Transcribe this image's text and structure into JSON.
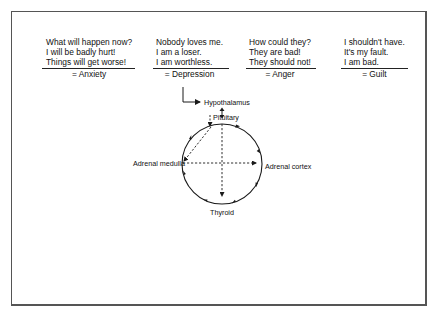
{
  "statements": [
    {
      "id": "anxiety",
      "lines": [
        "What will happen now?",
        "I will be badly hurt!",
        "Things will get worse!"
      ],
      "result": "= Anxiety"
    },
    {
      "id": "depression",
      "lines": [
        "Nobody loves me.",
        "I am a loser.",
        "I am worthless."
      ],
      "result": "= Depression"
    },
    {
      "id": "anger",
      "lines": [
        "How could they?",
        "They are bad!",
        "They should not!"
      ],
      "result": "= Anger"
    },
    {
      "id": "guilt",
      "lines": [
        "I shouldn't have.",
        "It's my fault.",
        "I am bad."
      ],
      "result": "= Guilt"
    }
  ],
  "diagram": {
    "nodes": {
      "hypothalamus": "Hypothalamus",
      "pituitary": "Pituitary",
      "adrenal_medulla": "Adrenal medulla",
      "adrenal_cortex": "Adrenal cortex",
      "thyroid": "Thyroid"
    },
    "colors": {
      "line": "#1a1a1a",
      "frame": "#555555"
    }
  }
}
